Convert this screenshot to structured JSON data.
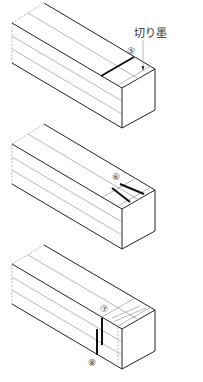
{
  "figure": {
    "blocks": [
      {
        "id": "block-1",
        "callouts": [
          {
            "marker": "⑤",
            "x": 131,
            "y": 52
          },
          {
            "text": "切り墨",
            "x": 134,
            "y": 36
          }
        ]
      },
      {
        "id": "block-2",
        "callouts": [
          {
            "marker": "⑥",
            "x": 116,
            "y": 179
          }
        ]
      },
      {
        "id": "block-3",
        "callouts": [
          {
            "marker": "⑦",
            "x": 104,
            "y": 311
          },
          {
            "marker": "⑧",
            "x": 93,
            "y": 365
          }
        ]
      }
    ]
  },
  "labels": {
    "cut_mark": "切り墨",
    "step5": "⑤",
    "step6": "⑥",
    "step7": "⑦",
    "step8": "⑧"
  }
}
